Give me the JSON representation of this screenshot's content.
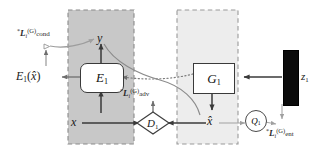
{
  "figure": {
    "type": "diagram",
    "title_visible": false,
    "background": "#ffffff",
    "panels": [
      {
        "id": "encoder-domain-panel",
        "label": "",
        "fill": "#c8c8c8",
        "stroke": "#8a8a8a",
        "x": 68,
        "y": 10,
        "w": 66,
        "h": 134
      },
      {
        "id": "generator-domain-panel",
        "label": "",
        "fill": "#ededed",
        "stroke": "#9a9a9a",
        "x": 177,
        "y": 10,
        "w": 61,
        "h": 134
      }
    ]
  },
  "nodes": {
    "encoder": {
      "name": "E",
      "index": "1"
    },
    "generator": {
      "name": "G",
      "index": "1"
    },
    "discriminator": {
      "name": "D",
      "index": "1"
    },
    "q_head": {
      "name": "Q",
      "index": "1"
    },
    "latent": {
      "name": "z",
      "index": "1"
    }
  },
  "variables": {
    "label_y": "y",
    "input_x": "x",
    "generated_x": "x̂",
    "encoder_output": {
      "fn": "E",
      "index": "1",
      "arg": "x̂"
    }
  },
  "losses": {
    "cond": {
      "star": "*",
      "symbol": "L",
      "index": "i",
      "group": "(G)",
      "tag": "cond"
    },
    "adv": {
      "star": "*",
      "symbol": "L",
      "index": "i",
      "group": "(G)",
      "tag": "adv"
    },
    "ent": {
      "star": "*",
      "symbol": "L",
      "index": "i",
      "group": "(G)",
      "tag": "ent"
    }
  },
  "colors": {
    "arrow_dark": "#3a3a3a",
    "arrow_mid": "#6e6e6e",
    "arrow_light": "#9d9d9d",
    "panel_left": "#c8c8c8",
    "panel_right": "#ededed",
    "latent_fill": "#0b0b0b",
    "text": "#1a1a1a"
  },
  "edges": [
    {
      "from": "x",
      "to": "E1",
      "style": "solid-dark",
      "arrow": true
    },
    {
      "from": "E1",
      "to": "y",
      "style": "solid-dark",
      "arrow": true
    },
    {
      "from": "E1",
      "to": "E1xh",
      "style": "solid-mid",
      "arrow": true
    },
    {
      "from": "E1xh",
      "to": "cond",
      "style": "solid-light",
      "arrow": true
    },
    {
      "from": "y",
      "to": "cond",
      "style": "solid-light",
      "arrow": true
    },
    {
      "from": "G1",
      "to": "E1",
      "style": "dotted-mid",
      "arrow": true
    },
    {
      "from": "y",
      "to": "D1",
      "style": "solid-mid",
      "arrow": true
    },
    {
      "from": "z1",
      "to": "G1",
      "style": "solid-dark",
      "arrow": true
    },
    {
      "from": "G1",
      "to": "xhat",
      "style": "solid-dark",
      "arrow": true
    },
    {
      "from": "x",
      "to": "D1",
      "style": "solid-dark",
      "arrow": true
    },
    {
      "from": "xhat",
      "to": "D1",
      "style": "solid-dark",
      "arrow": true
    },
    {
      "from": "D1",
      "to": "adv",
      "style": "solid-mid",
      "arrow": true
    },
    {
      "from": "xhat",
      "to": "Q1",
      "style": "solid-light",
      "arrow": true
    },
    {
      "from": "Q1",
      "to": "ent",
      "style": "solid-light",
      "arrow": true
    },
    {
      "from": "z1",
      "to": "ent",
      "style": "solid-light",
      "arrow": true
    }
  ]
}
